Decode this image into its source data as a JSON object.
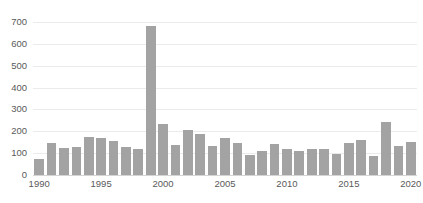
{
  "chart_data": {
    "type": "bar",
    "title": "",
    "subtitle": "",
    "xlabel": "",
    "ylabel": "",
    "categories": [
      "1990",
      "1991",
      "1992",
      "1993",
      "1994",
      "1995",
      "1996",
      "1997",
      "1998",
      "1999",
      "2000",
      "2001",
      "2002",
      "2003",
      "2004",
      "2005",
      "2006",
      "2007",
      "2008",
      "2009",
      "2010",
      "2011",
      "2012",
      "2013",
      "2014",
      "2015",
      "2016",
      "2017",
      "2018",
      "2019",
      "2020"
    ],
    "values": [
      75,
      145,
      122,
      130,
      176,
      168,
      155,
      130,
      121,
      680,
      235,
      139,
      205,
      186,
      132,
      170,
      148,
      92,
      110,
      141,
      121,
      110,
      118,
      121,
      96,
      146,
      160,
      85,
      243,
      131,
      151
    ],
    "ylim": [
      0,
      700
    ],
    "yticks": [
      0,
      100,
      200,
      300,
      400,
      500,
      600,
      700
    ],
    "ytick_labels": [
      "0",
      "100",
      "200",
      "300",
      "400",
      "500",
      "600",
      "700"
    ],
    "xtick_labels": [
      "1990",
      "1995",
      "2000",
      "2005",
      "2010",
      "2015",
      "2020"
    ],
    "xticks": [
      1990,
      1995,
      2000,
      2005,
      2010,
      2015,
      2020
    ],
    "grid": true,
    "grid_axis": "y",
    "legend": false,
    "legend_position": "none",
    "bar_color": "#a3a3a3",
    "grid_color": "#ebebeb",
    "axis_color": "#d4d4d4",
    "tick_label_color": "#5a5a5a",
    "background_color": "#ffffff",
    "series": [
      {
        "name": "",
        "values": [
          75,
          145,
          122,
          130,
          176,
          168,
          155,
          130,
          121,
          680,
          235,
          139,
          205,
          186,
          132,
          170,
          148,
          92,
          110,
          141,
          121,
          110,
          118,
          121,
          96,
          146,
          160,
          85,
          243,
          131,
          151
        ]
      }
    ]
  }
}
